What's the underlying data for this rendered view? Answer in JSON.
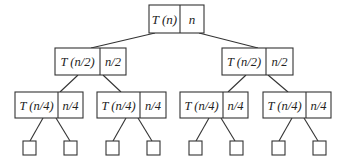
{
  "diagram": {
    "type": "recursion-tree",
    "levels": [
      {
        "nodes": [
          {
            "cost_term": "T (n)",
            "size": "n"
          }
        ]
      },
      {
        "nodes": [
          {
            "cost_term": "T (n/2)",
            "size": "n/2"
          },
          {
            "cost_term": "T (n/2)",
            "size": "n/2"
          }
        ]
      },
      {
        "nodes": [
          {
            "cost_term": "T (n/4)",
            "size": "n/4"
          },
          {
            "cost_term": "T (n/4)",
            "size": "n/4"
          },
          {
            "cost_term": "T (n/4)",
            "size": "n/4"
          },
          {
            "cost_term": "T (n/4)",
            "size": "n/4"
          }
        ]
      },
      {
        "leaf_count": 8,
        "leaf_shape": "empty-square"
      }
    ],
    "colors": {
      "stroke": "#333333",
      "background": "#ffffff",
      "text": "#222222"
    }
  }
}
